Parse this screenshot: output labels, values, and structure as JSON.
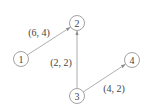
{
  "graph": {
    "nodes": [
      {
        "id": "1",
        "label": "1"
      },
      {
        "id": "2",
        "label": "2"
      },
      {
        "id": "3",
        "label": "3"
      },
      {
        "id": "4",
        "label": "4"
      }
    ],
    "edges": [
      {
        "from": "1",
        "to": "2",
        "label": "(6, 4)"
      },
      {
        "from": "3",
        "to": "2",
        "label": "(2, 2)"
      },
      {
        "from": "3",
        "to": "4",
        "label": "(4, 2)"
      }
    ],
    "colors": {
      "node_stroke": "#8a8a8a",
      "edge_stroke": "#9a9a9a",
      "text": "#444444"
    }
  }
}
